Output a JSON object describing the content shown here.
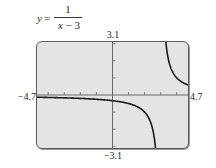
{
  "equation": {
    "lhs": "y",
    "equals": "=",
    "numerator": "1",
    "denominator_var": "x",
    "denominator_rest": " − 3"
  },
  "window": {
    "xmin_label": "−4.7",
    "xmax_label": "4.7",
    "ymin_label": "−3.1",
    "ymax_label": "3.1"
  },
  "colors": {
    "screen_bg": "#e4e4e4",
    "frame": "#5a5a5a",
    "axis": "#6a6a6a",
    "curve": "#1a1a1a"
  },
  "chart_data": {
    "type": "line",
    "function": "1/(x-3)",
    "xlabel": "",
    "ylabel": "",
    "xlim": [
      -4.7,
      4.7
    ],
    "ylim": [
      -3.1,
      3.1
    ],
    "xscale": 1,
    "yscale": 1,
    "grid": false,
    "legend": null,
    "vertical_asymptote": 3,
    "horizontal_asymptote": 0,
    "series": [
      {
        "name": "left branch (x < 3)",
        "x": [
          -4.7,
          -4.0,
          -3.0,
          -2.0,
          -1.0,
          0.0,
          1.0,
          1.5,
          2.0,
          2.3,
          2.5,
          2.6,
          2.68
        ],
        "y": [
          -0.13,
          -0.143,
          -0.167,
          -0.2,
          -0.25,
          -0.333,
          -0.5,
          -0.667,
          -1.0,
          -1.429,
          -2.0,
          -2.5,
          -3.1
        ]
      },
      {
        "name": "right branch (x > 3)",
        "x": [
          3.32,
          3.4,
          3.5,
          3.7,
          4.0,
          4.3,
          4.7
        ],
        "y": [
          3.1,
          2.5,
          2.0,
          1.429,
          1.0,
          0.769,
          0.588
        ]
      }
    ]
  }
}
